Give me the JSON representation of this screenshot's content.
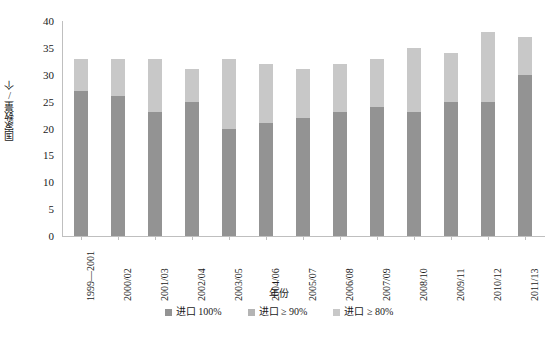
{
  "chart_data": {
    "type": "bar",
    "subtype": "stacked-column",
    "title": "",
    "xlabel": "年份",
    "ylabel": "国家数量/个",
    "ylim": [
      0,
      40
    ],
    "yticks": [
      0,
      5,
      10,
      15,
      20,
      25,
      30,
      35,
      40
    ],
    "ytick_labels": [
      "0",
      "5",
      "10",
      "15",
      "20",
      "25",
      "30",
      "35",
      "40"
    ],
    "grid": false,
    "legend_position": "bottom",
    "categories": [
      "1999—2001",
      "2000/02",
      "2001/03",
      "2002/04",
      "2003/05",
      "2004/06",
      "2005/07",
      "2006/08",
      "2007/09",
      "2008/10",
      "2009/11",
      "2010/12",
      "2011/13"
    ],
    "series": [
      {
        "name": "进口 100%",
        "color": "#939393",
        "values": [
          27,
          26,
          23,
          25,
          20,
          21,
          22,
          23,
          24,
          23,
          25,
          25,
          30
        ]
      },
      {
        "name": "进口 ≥ 90%",
        "color": "#b4b4b4",
        "values": [
          0,
          0,
          0,
          0,
          0,
          0,
          0,
          0,
          0,
          0,
          0,
          0,
          0
        ]
      },
      {
        "name": "进口 ≥ 80%",
        "color": "#c8c8c8",
        "values": [
          6,
          7,
          10,
          6,
          13,
          11,
          9,
          9,
          9,
          12,
          9,
          13,
          7
        ]
      }
    ],
    "totals": [
      33,
      33,
      33,
      31,
      33,
      32,
      31,
      32,
      33,
      35,
      34,
      38,
      37
    ]
  },
  "legend": {
    "items": [
      {
        "label": "进口 100%",
        "color": "#939393"
      },
      {
        "label": "进口 ≥ 90%",
        "color": "#b4b4b4"
      },
      {
        "label": "进口 ≥ 80%",
        "color": "#c8c8c8"
      }
    ]
  },
  "axes": {
    "y_title": "国家数量/个",
    "x_title": "年份"
  }
}
